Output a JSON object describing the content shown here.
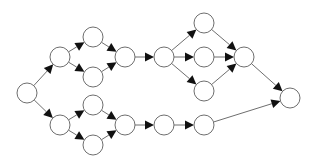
{
  "diagram": {
    "type": "directed-graph",
    "style": {
      "background": "#ffffff",
      "node_fill": "#ffffff",
      "node_stroke": "#6e6e6e",
      "edge_stroke": "#6e6e6e",
      "arrow_fill": "#111111",
      "node_radius": 10
    },
    "nodes": [
      {
        "id": "n0",
        "x": 27,
        "y": 93
      },
      {
        "id": "n1",
        "x": 60,
        "y": 57
      },
      {
        "id": "n2",
        "x": 93,
        "y": 37
      },
      {
        "id": "n3",
        "x": 93,
        "y": 77
      },
      {
        "id": "n4",
        "x": 125,
        "y": 57
      },
      {
        "id": "n5",
        "x": 164,
        "y": 57
      },
      {
        "id": "n6",
        "x": 204,
        "y": 23
      },
      {
        "id": "n7",
        "x": 204,
        "y": 57
      },
      {
        "id": "n8",
        "x": 204,
        "y": 91
      },
      {
        "id": "n9",
        "x": 244,
        "y": 57
      },
      {
        "id": "n10",
        "x": 290,
        "y": 98
      },
      {
        "id": "n11",
        "x": 60,
        "y": 125
      },
      {
        "id": "n12",
        "x": 93,
        "y": 105
      },
      {
        "id": "n13",
        "x": 93,
        "y": 145
      },
      {
        "id": "n14",
        "x": 125,
        "y": 125
      },
      {
        "id": "n15",
        "x": 164,
        "y": 125
      },
      {
        "id": "n16",
        "x": 204,
        "y": 125
      }
    ],
    "edges": [
      {
        "from": "n0",
        "to": "n1"
      },
      {
        "from": "n0",
        "to": "n11"
      },
      {
        "from": "n1",
        "to": "n2"
      },
      {
        "from": "n1",
        "to": "n3"
      },
      {
        "from": "n2",
        "to": "n4"
      },
      {
        "from": "n3",
        "to": "n4"
      },
      {
        "from": "n4",
        "to": "n5"
      },
      {
        "from": "n5",
        "to": "n6"
      },
      {
        "from": "n5",
        "to": "n7"
      },
      {
        "from": "n5",
        "to": "n8"
      },
      {
        "from": "n6",
        "to": "n9"
      },
      {
        "from": "n7",
        "to": "n9"
      },
      {
        "from": "n8",
        "to": "n9"
      },
      {
        "from": "n9",
        "to": "n10"
      },
      {
        "from": "n11",
        "to": "n12"
      },
      {
        "from": "n11",
        "to": "n13"
      },
      {
        "from": "n12",
        "to": "n14"
      },
      {
        "from": "n13",
        "to": "n14"
      },
      {
        "from": "n14",
        "to": "n15"
      },
      {
        "from": "n15",
        "to": "n16"
      },
      {
        "from": "n16",
        "to": "n10"
      }
    ]
  }
}
